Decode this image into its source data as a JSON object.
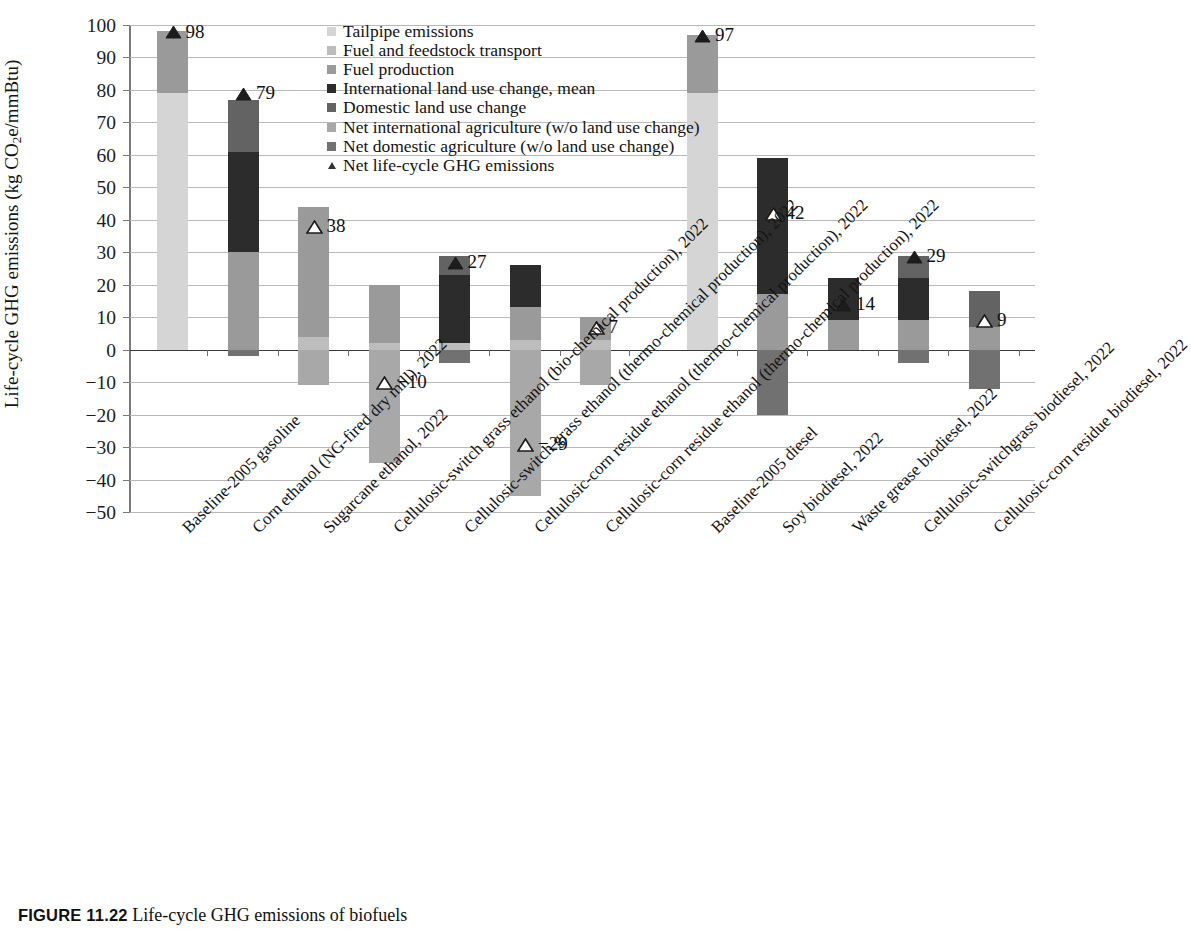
{
  "chart_data": {
    "type": "bar",
    "subtype": "stacked-bar-with-net-marker",
    "title": "",
    "xlabel": "",
    "ylabel": "Life-cycle GHG emissions (kg CO2e/mmBtu)",
    "ylim": [
      -50,
      100
    ],
    "ytick_values": [
      100,
      90,
      80,
      70,
      60,
      50,
      40,
      30,
      20,
      10,
      0,
      -10,
      -20,
      -30,
      -40,
      -50
    ],
    "ytick_labels": [
      "100",
      "90",
      "80",
      "70",
      "60",
      "50",
      "40",
      "30",
      "20",
      "10",
      "0",
      "−10",
      "−20",
      "−30",
      "−40",
      "−50"
    ],
    "grid": true,
    "legend_position": "top-center",
    "categories": [
      "Baseline-2005 gasoline",
      "Corn ethanol (NG-fired dry mill), 2022",
      "Sugarcane ethanol, 2022",
      "Cellulosic-switch grass ethanol (bio-chemical production), 2022",
      "Cellulosic-switch grass ethanol (thermo-chemical production), 2022",
      "Cellulosic-corn residue ethanol (thermo-chemical production), 2022",
      "Cellulosic-corn residue ethanol (thermo-chemical production), 2022",
      "Baseline-2005 diesel",
      "Soy biodiesel, 2022",
      "Waste grease biodiesel, 2022",
      "Cellulosic-switchgrass biodiesel, 2022",
      "Cellulosic-corn residue biodiesel, 2022"
    ],
    "series": [
      {
        "name": "Tailpipe emissions",
        "color": "#d5d5d5",
        "values": [
          79,
          0,
          0,
          0,
          0,
          0,
          0,
          79,
          0,
          0,
          0,
          0
        ]
      },
      {
        "name": "Fuel and feedstock transport",
        "color": "#bdbdbd",
        "values": [
          0,
          0,
          4,
          2,
          2,
          3,
          3,
          0,
          0,
          0,
          0,
          0
        ]
      },
      {
        "name": "Fuel production",
        "color": "#9a9a9a",
        "values": [
          19,
          30,
          40,
          18,
          0,
          10,
          7,
          18,
          17,
          9,
          9,
          7
        ]
      },
      {
        "name": "International land use change, mean",
        "color": "#2c2c2c",
        "values": [
          0,
          31,
          0,
          0,
          21,
          13,
          0,
          0,
          42,
          13,
          13,
          0
        ]
      },
      {
        "name": "Domestic land use change",
        "color": "#636363",
        "values": [
          0,
          16,
          0,
          0,
          6,
          0,
          0,
          0,
          0,
          0,
          7,
          11
        ]
      },
      {
        "name": "Net international agriculture (w/o land use change)",
        "color": "#a8a8a8",
        "values": [
          0,
          0,
          -11,
          -35,
          0,
          -45,
          -11,
          0,
          0,
          0,
          0,
          0
        ]
      },
      {
        "name": "Net domestic agriculture (w/o land use change)",
        "color": "#717171",
        "values": [
          0,
          -2,
          0,
          0,
          -4,
          0,
          0,
          0,
          -20,
          0,
          -4,
          -12
        ]
      }
    ],
    "net_marker": {
      "name": "Net life-cycle GHG emissions",
      "values": [
        98,
        79,
        38,
        -10,
        27,
        -29,
        7,
        97,
        42,
        14,
        29,
        9
      ],
      "labels": [
        "98",
        "79",
        "38",
        "−10",
        "27",
        "−29",
        "7",
        "97",
        "42",
        "14",
        "29",
        "9"
      ],
      "filled": [
        true,
        true,
        false,
        false,
        true,
        false,
        false,
        true,
        false,
        true,
        true,
        false
      ]
    }
  },
  "axis": {
    "y_title_prefix": "Life-cycle GHG emissions (kg CO",
    "y_title_sub": "2",
    "y_title_suffix": "e/mmBtu)"
  },
  "legend": {
    "items": [
      {
        "label": "Tailpipe emissions",
        "color": "#d5d5d5",
        "shape": "square"
      },
      {
        "label": "Fuel and feedstock transport",
        "color": "#bdbdbd",
        "shape": "square"
      },
      {
        "label": "Fuel production",
        "color": "#9a9a9a",
        "shape": "square"
      },
      {
        "label": "International land use change, mean",
        "color": "#2c2c2c",
        "shape": "square"
      },
      {
        "label": "Domestic land use change",
        "color": "#636363",
        "shape": "square"
      },
      {
        "label": "Net international agriculture (w/o land use change)",
        "color": "#a8a8a8",
        "shape": "square"
      },
      {
        "label": "Net domestic agriculture (w/o land use change)",
        "color": "#717171",
        "shape": "square"
      },
      {
        "label": "Net life-cycle GHG emissions",
        "color": "#333333",
        "shape": "triangle"
      }
    ]
  },
  "caption": {
    "figure_number": "FIGURE 11.22",
    "text": "Life-cycle GHG emissions of biofuels"
  }
}
